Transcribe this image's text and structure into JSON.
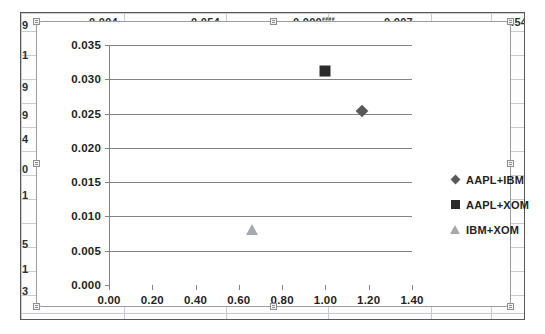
{
  "chart_data": {
    "type": "scatter",
    "title": "",
    "xlabel": "",
    "ylabel": "",
    "xlim": [
      0.0,
      1.4
    ],
    "ylim": [
      0.0,
      0.035
    ],
    "grid": "horizontal",
    "legend_position": "right",
    "x_ticks": [
      "0.00",
      "0.20",
      "0.40",
      "0.60",
      "0.80",
      "1.00",
      "1.20",
      "1.40"
    ],
    "x_tick_values": [
      0.0,
      0.2,
      0.4,
      0.6,
      0.8,
      1.0,
      1.2,
      1.4
    ],
    "y_ticks": [
      "0.000",
      "0.005",
      "0.010",
      "0.015",
      "0.020",
      "0.025",
      "0.030",
      "0.035"
    ],
    "y_tick_values": [
      0.0,
      0.005,
      0.01,
      0.015,
      0.02,
      0.025,
      0.03,
      0.035
    ],
    "series": [
      {
        "name": "AAPL+IBM",
        "marker": "diamond",
        "color": "#58595b",
        "points": [
          {
            "x": 1.17,
            "y": 0.0254
          }
        ]
      },
      {
        "name": "AAPL+XOM",
        "marker": "square",
        "color": "#2b2b2b",
        "points": [
          {
            "x": 1.0,
            "y": 0.0312
          }
        ]
      },
      {
        "name": "IBM+XOM",
        "marker": "triangle",
        "color": "#a7a9ac",
        "points": [
          {
            "x": 0.66,
            "y": 0.008
          }
        ]
      }
    ]
  },
  "legend": {
    "items": [
      {
        "label": "AAPL+IBM"
      },
      {
        "label": "AAPL+XOM"
      },
      {
        "label": "IBM+XOM"
      }
    ]
  },
  "sheet": {
    "top_row": [
      {
        "text": "0.004",
        "left": 68
      },
      {
        "text": "0.054",
        "left": 170
      },
      {
        "text": "0.000",
        "left": 272,
        "hash": "####"
      },
      {
        "text": "0.007",
        "left": 363
      },
      {
        "text": "4545",
        "left": 487
      }
    ],
    "left_column": [
      {
        "text": "9",
        "top": 6
      },
      {
        "text": "1",
        "top": 36
      },
      {
        "text": "9",
        "top": 68
      },
      {
        "text": "9",
        "top": 96
      },
      {
        "text": "4",
        "top": 120
      },
      {
        "text": "0",
        "top": 150
      },
      {
        "text": "1",
        "top": 176
      },
      {
        "text": "5",
        "top": 225
      },
      {
        "text": "1",
        "top": 250
      },
      {
        "text": "3",
        "top": 272
      }
    ]
  }
}
